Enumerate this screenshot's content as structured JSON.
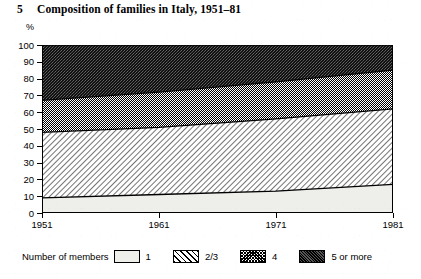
{
  "figure": {
    "number": "5",
    "title": "Composition of families in Italy, 1951–81"
  },
  "axes": {
    "unit_label": "%",
    "y_ticks": [
      "100",
      "90",
      "80",
      "70",
      "60",
      "50",
      "40",
      "30",
      "20",
      "10",
      "0"
    ],
    "x_ticks": [
      "1951",
      "1961",
      "1971",
      "1981"
    ]
  },
  "legend": {
    "title": "Number of members",
    "entries": [
      {
        "label": "1",
        "pattern": "blank-light",
        "swatch_name": "legend-swatch-one-member"
      },
      {
        "label": "2/3",
        "pattern": "diagonal-hatch",
        "swatch_name": "legend-swatch-two-three-members"
      },
      {
        "label": "4",
        "pattern": "fine-crosshatch-grey",
        "swatch_name": "legend-swatch-four-members"
      },
      {
        "label": "5 or more",
        "pattern": "dark-stipple",
        "swatch_name": "legend-swatch-five-or-more-members"
      }
    ]
  },
  "chart_data": {
    "type": "area",
    "stacked": true,
    "title": "Composition of families in Italy, 1951–81",
    "xlabel": "",
    "ylabel": "%",
    "unit": "%",
    "x": [
      1951,
      1961,
      1971,
      1981
    ],
    "xlim": [
      1951,
      1981
    ],
    "ylim": [
      0,
      100
    ],
    "y_tick_step": 10,
    "grid": false,
    "legend_position": "below-plot",
    "legend_title": "Number of members",
    "series": [
      {
        "name": "1",
        "values": [
          9,
          11,
          13,
          17
        ],
        "cumulative_top": [
          9,
          11,
          13,
          17
        ],
        "pattern": "blank-light"
      },
      {
        "name": "2/3",
        "values": [
          39,
          40,
          43,
          45
        ],
        "cumulative_top": [
          48,
          51,
          56,
          62
        ],
        "pattern": "diagonal-hatch"
      },
      {
        "name": "4",
        "values": [
          19,
          21,
          22,
          23
        ],
        "cumulative_top": [
          67,
          72,
          78,
          85
        ],
        "pattern": "fine-crosshatch-grey"
      },
      {
        "name": "5 or more",
        "values": [
          33,
          28,
          22,
          15
        ],
        "cumulative_top": [
          100,
          100,
          100,
          100
        ],
        "pattern": "dark-stipple"
      }
    ]
  },
  "colors": {
    "ink": "#000000",
    "band_one": "#eeeeea",
    "band_two_three": "#ffffff",
    "band_four": "#b8b8b8",
    "band_five_plus": "#2b2b2b"
  }
}
